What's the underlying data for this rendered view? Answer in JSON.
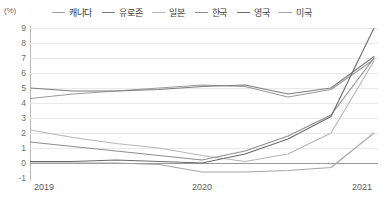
{
  "chart": {
    "unit_label": "(%)",
    "axis_color": "#b9b9b9",
    "grid_color": "#e9e9e9",
    "zero_line_color": "#9a9a9a"
  },
  "legend": {
    "position": "top",
    "items": [
      {
        "label": "캐나다",
        "color": "#9b9b9b"
      },
      {
        "label": "유로존",
        "color": "#7d7d7d"
      },
      {
        "label": "일본",
        "color": "#b5b5b5"
      },
      {
        "label": "한국",
        "color": "#8e8e8e"
      },
      {
        "label": "영국",
        "color": "#6a6a6a"
      },
      {
        "label": "미국",
        "color": "#a5a5a5"
      }
    ]
  },
  "chart_data": {
    "type": "line",
    "title": "",
    "xlabel": "",
    "ylabel": "(%)",
    "ylim": [
      -1,
      9
    ],
    "yticks": [
      -1,
      0,
      1,
      2,
      3,
      4,
      5,
      6,
      7,
      8,
      9
    ],
    "grid": true,
    "legend_position": "top",
    "x": [
      "2019",
      "2019 Q2",
      "2019 Q3",
      "2019 Q4",
      "2020",
      "2020 Q2",
      "2020 Q3",
      "2020 Q4",
      "2021"
    ],
    "xtick_labels": [
      "2019",
      "2020",
      "2021"
    ],
    "xtick_positions": [
      0,
      4,
      8
    ],
    "series": [
      {
        "name": "캐나다",
        "color": "#9b9b9b",
        "values": [
          4.3,
          4.6,
          4.8,
          5.0,
          5.2,
          5.1,
          4.4,
          4.9,
          6.9
        ]
      },
      {
        "name": "유로존",
        "color": "#7d7d7d",
        "values": [
          5.0,
          4.8,
          4.8,
          4.9,
          5.1,
          5.2,
          4.6,
          5.0,
          7.1
        ]
      },
      {
        "name": "일본",
        "color": "#b5b5b5",
        "values": [
          2.2,
          1.7,
          1.3,
          1.0,
          0.5,
          0.1,
          0.6,
          2.0,
          6.8
        ]
      },
      {
        "name": "한국",
        "color": "#8e8e8e",
        "values": [
          1.4,
          1.1,
          0.8,
          0.5,
          0.2,
          0.8,
          1.8,
          3.2,
          7.0
        ]
      },
      {
        "name": "영국",
        "color": "#6a6a6a",
        "values": [
          0.1,
          0.1,
          0.2,
          0.1,
          0.0,
          0.6,
          1.6,
          3.1,
          9.0
        ]
      },
      {
        "name": "미국",
        "color": "#a5a5a5",
        "values": [
          0.0,
          0.0,
          0.0,
          -0.1,
          -0.6,
          -0.6,
          -0.5,
          -0.3,
          2.0
        ]
      }
    ]
  }
}
